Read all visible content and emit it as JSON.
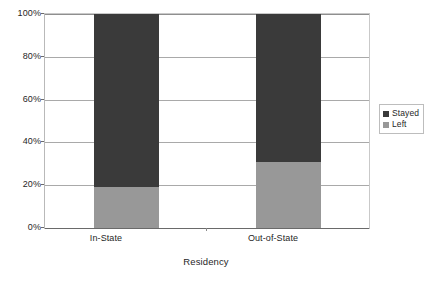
{
  "chart_data": {
    "type": "bar",
    "subtype": "stacked-100-percent",
    "title": "",
    "xlabel": "Residency",
    "ylabel": "",
    "categories": [
      "In-State",
      "Out-of-State"
    ],
    "series": [
      {
        "name": "Stayed",
        "color": "#3a3a3a",
        "values": [
          81,
          69
        ]
      },
      {
        "name": "Left",
        "color": "#989898",
        "values": [
          19,
          31
        ]
      }
    ],
    "stack_order_bottom_to_top": [
      "Left",
      "Stayed"
    ],
    "ylim": [
      0,
      100
    ],
    "y_tick_labels": [
      "0%",
      "20%",
      "40%",
      "60%",
      "80%",
      "100%"
    ],
    "y_tick_values": [
      0,
      20,
      40,
      60,
      80,
      100
    ],
    "grid": true,
    "legend_position": "right",
    "legend_entries": [
      "Stayed",
      "Left"
    ]
  },
  "axis": {
    "x_title": "Residency"
  },
  "legend": {
    "items": [
      {
        "label": "Stayed"
      },
      {
        "label": "Left"
      }
    ]
  }
}
